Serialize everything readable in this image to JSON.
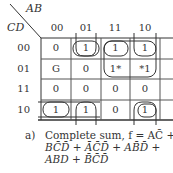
{
  "kmap": {
    "row_var": "CD",
    "col_var": "AB",
    "col_headers": [
      "00",
      "01",
      "11",
      "10"
    ],
    "row_headers": [
      "00",
      "01",
      "11",
      "10"
    ],
    "cells": [
      [
        "0",
        "1",
        "1",
        "1"
      ],
      [
        "G",
        "0",
        "1*",
        "*1"
      ],
      [
        "0",
        "0",
        "0",
        "0"
      ],
      [
        "1",
        "1",
        "0",
        "1"
      ]
    ]
  },
  "caption": {
    "label": "a)",
    "line1": "Complete sum, f = AC̄ +",
    "line2": "BC̄D̄ + ĀC̄D̄ + AB̄D̄ +",
    "line3": "ABD + B̄C̄D̄"
  }
}
